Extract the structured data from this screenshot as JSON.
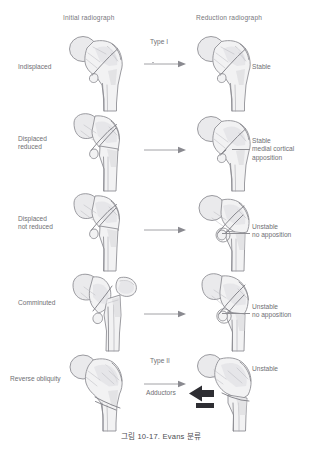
{
  "figure": {
    "caption": "그림 10-17. Evans 분류",
    "headers": {
      "initial": "Initial radiograph",
      "reduction": "Reduction radiograph"
    },
    "types": {
      "type_1": "Type I",
      "type_2": "Type II"
    },
    "force_label": "Adductors",
    "rows": [
      {
        "id": "undisplaced",
        "left_label": "Indisplaced",
        "right_label": "Stable",
        "type_label": "Type I",
        "has_arrow": true,
        "has_leader": false
      },
      {
        "id": "displaced-reduced",
        "left_label": "Displaced\nreduced",
        "right_label": "Stable\nmedial cortical\napposition",
        "type_label": "",
        "has_arrow": true,
        "has_leader": true
      },
      {
        "id": "displaced-not-reduced",
        "left_label": "Displaced\nnot reduced",
        "right_label": "Unstable\nno apposition",
        "type_label": "",
        "has_arrow": true,
        "has_leader": true
      },
      {
        "id": "comminuted",
        "left_label": "Comminuted",
        "right_label": "Unstable\nno apposition",
        "type_label": "",
        "has_arrow": true,
        "has_leader": true
      },
      {
        "id": "reverse-obliquity",
        "left_label": "Reverse obliquity",
        "right_label": "Unstable",
        "type_label": "Type II",
        "has_arrow": true,
        "has_leader": false
      }
    ],
    "colors": {
      "background": "#ffffff",
      "outline": "#8a8a90",
      "bone_fill": "#f2f2f3",
      "text": "#6f6f74",
      "caption_text": "#4b4b50",
      "force_arrow": "#2e2e33"
    }
  }
}
